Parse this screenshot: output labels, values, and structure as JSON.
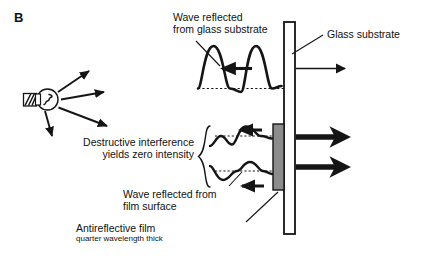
{
  "figure": {
    "panel_letter": "B",
    "background_color": "#ffffff",
    "ink_color": "#111111",
    "film_color": "#8c8c8c",
    "glass_color": "#ffffff"
  },
  "labels": {
    "wave_reflected_glass_line1": "Wave reflected",
    "wave_reflected_glass_line2": "from glass substrate",
    "glass_substrate": "Glass substrate",
    "destructive_line1": "Destructive interference",
    "destructive_line2": "yields zero intensity",
    "wave_reflected_film_line1": "Wave reflected from",
    "wave_reflected_film_line2": "film surface",
    "antireflective_film": "Antireflective film",
    "antireflective_film_sub": "quarter wavelength thick"
  },
  "elements": {
    "light_source": "light-bulb",
    "light_source_rays": 4,
    "waves": [
      {
        "name": "reflected-from-glass-substrate",
        "amplitude": "large",
        "direction": "leftward",
        "baseline": "dotted"
      },
      {
        "name": "reflected-from-film-surface-upper",
        "amplitude": "small",
        "direction": "leftward",
        "baseline": "dotted"
      },
      {
        "name": "reflected-from-film-surface-lower",
        "amplitude": "small",
        "direction": "leftward",
        "baseline": "dotted"
      }
    ],
    "transmitted_arrows": [
      {
        "name": "thin-transmitted-arrow",
        "weight": "thin"
      },
      {
        "name": "thick-transmitted-arrow-upper",
        "weight": "thick"
      },
      {
        "name": "thick-transmitted-arrow-lower",
        "weight": "thick"
      }
    ],
    "brace": "curly-brace-destructive-interference"
  }
}
